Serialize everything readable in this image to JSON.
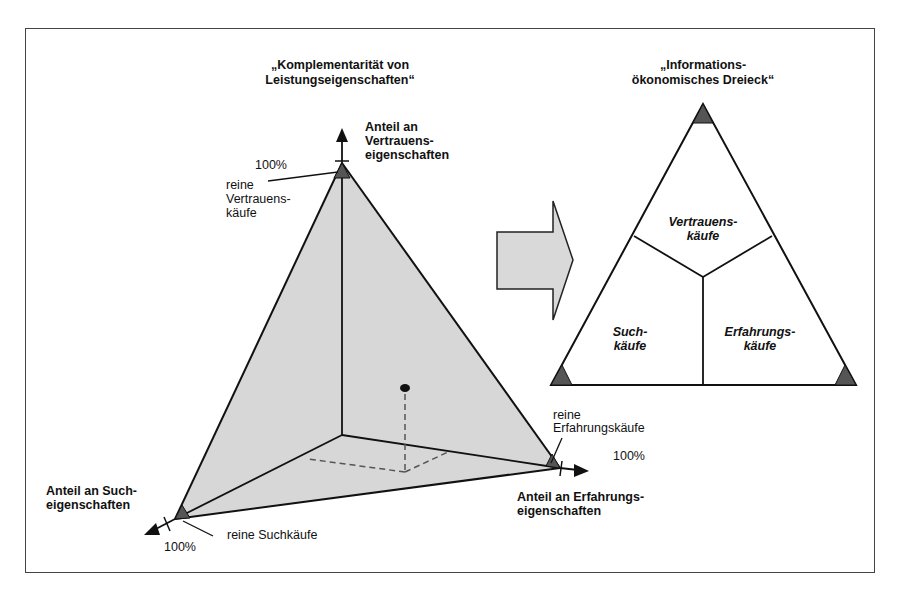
{
  "colors": {
    "face_fill": "#d7d7d7",
    "corner_fill": "#555555",
    "arrow_fill": "#d9d9d9",
    "line": "#111111",
    "frame": "#444444"
  },
  "left_diagram": {
    "title_line1": "„Komplementarität von",
    "title_line2": "Leistungseigenschaften“",
    "axis_vertical": {
      "line1": "Anteil an",
      "line2": "Vertrauens-",
      "line3": "eigenschaften",
      "percent": "100%"
    },
    "axis_left": {
      "line1": "Anteil an Such-",
      "line2": "eigenschaften",
      "percent": "100%"
    },
    "axis_right": {
      "line1": "Anteil an Erfahrungs-",
      "line2": "eigenschaften",
      "percent": "100%"
    },
    "corner_top": {
      "line1": "reine",
      "line2": "Vertrauens-",
      "line3": "käufe"
    },
    "corner_left": {
      "label": "reine Suchkäufe"
    },
    "corner_right": {
      "line1": "reine",
      "line2": "Erfahrungskäufe"
    }
  },
  "transition_arrow": {
    "icon": "block-arrow-right-icon"
  },
  "right_diagram": {
    "title_line1": "„Informations-",
    "title_line2": "ökonomisches Dreieck“",
    "region_top": {
      "line1": "Vertrauens-",
      "line2": "käufe"
    },
    "region_left": {
      "line1": "Such-",
      "line2": "käufe"
    },
    "region_right": {
      "line1": "Erfahrungs-",
      "line2": "käufe"
    }
  }
}
